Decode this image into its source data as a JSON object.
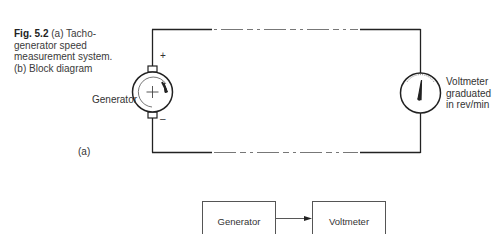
{
  "caption": {
    "fig_label": "Fig. 5.2",
    "text": "(a) Tacho-generator speed measurement system. (b) Block diagram"
  },
  "circuit": {
    "generator_label": "Generator",
    "plus_sign": "+",
    "minus_sign": "–",
    "voltmeter_label_lines": [
      "Voltmeter",
      "graduated",
      "in rev/min"
    ],
    "part_label": "(a)"
  },
  "block_diagram": {
    "blocks": [
      {
        "label": "Generator"
      },
      {
        "label": "Voltmeter"
      }
    ]
  }
}
